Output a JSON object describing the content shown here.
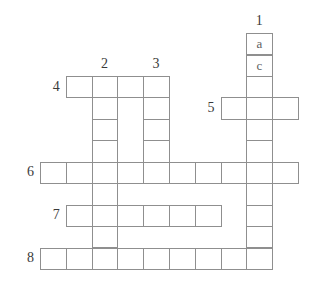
{
  "colors": {
    "background": "#ffffff",
    "grid_line": "#8f8f8f",
    "number": "#3a3a3a",
    "letter": "#606060"
  },
  "puzzle": {
    "type": "crossword",
    "rows": 11,
    "cols": 10,
    "words": [
      {
        "number": "1",
        "direction": "down",
        "row": 0,
        "col": 8,
        "length": 11
      },
      {
        "number": "2",
        "direction": "down",
        "row": 2,
        "col": 2,
        "length": 9
      },
      {
        "number": "3",
        "direction": "down",
        "row": 2,
        "col": 4,
        "length": 5
      },
      {
        "number": "4",
        "direction": "across",
        "row": 2,
        "col": 1,
        "length": 4
      },
      {
        "number": "5",
        "direction": "across",
        "row": 3,
        "col": 7,
        "length": 3
      },
      {
        "number": "6",
        "direction": "across",
        "row": 6,
        "col": 0,
        "length": 10
      },
      {
        "number": "7",
        "direction": "across",
        "row": 8,
        "col": 1,
        "length": 6
      },
      {
        "number": "8",
        "direction": "across",
        "row": 10,
        "col": 0,
        "length": 9
      }
    ],
    "letters": [
      {
        "row": 0,
        "col": 8,
        "letter": "a"
      },
      {
        "row": 1,
        "col": 8,
        "letter": "c"
      }
    ]
  }
}
